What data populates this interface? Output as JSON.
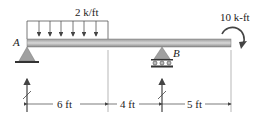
{
  "diagram": {
    "type": "beam",
    "distributed_load": {
      "label": "2 k/ft",
      "start_ft": 0,
      "end_ft": 6
    },
    "moment": {
      "label": "10 k-ft",
      "position_ft": 15,
      "direction": "clockwise"
    },
    "supports": [
      {
        "label": "A",
        "type": "pin",
        "position_ft": 0
      },
      {
        "label": "B",
        "type": "roller",
        "position_ft": 10
      }
    ],
    "dimensions": [
      {
        "label": "6 ft"
      },
      {
        "label": "4 ft"
      },
      {
        "label": "5 ft"
      }
    ],
    "colors": {
      "beam": "#a8a8a8",
      "support": "#9a9a9a",
      "line": "#333333"
    }
  }
}
